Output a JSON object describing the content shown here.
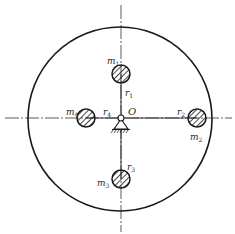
{
  "diagram": {
    "type": "rotor balancing schematic",
    "colors": {
      "stroke": "#1a1a1a",
      "axis": "#333333",
      "background": "#ffffff"
    },
    "disc": {
      "cx": 120,
      "cy": 119,
      "r": 92
    },
    "pivot": {
      "label": "O",
      "x": 121,
      "y": 118
    },
    "axes": {
      "horizontal": {
        "y": 118,
        "x1": 5,
        "x2": 232
      },
      "vertical": {
        "x": 121,
        "y1": 5,
        "y2": 232
      }
    },
    "masses": [
      {
        "id": "m1",
        "mass_label": "m",
        "mass_sub": "1",
        "radius_label": "r",
        "radius_sub": "1",
        "cx": 121,
        "cy": 74,
        "r": 9
      },
      {
        "id": "m2",
        "mass_label": "m",
        "mass_sub": "2",
        "radius_label": "r",
        "radius_sub": "2",
        "cx": 197,
        "cy": 118,
        "r": 9
      },
      {
        "id": "m3",
        "mass_label": "m",
        "mass_sub": "3",
        "radius_label": "r",
        "radius_sub": "3",
        "cx": 121,
        "cy": 179,
        "r": 9
      },
      {
        "id": "m4",
        "mass_label": "m",
        "mass_sub": "4",
        "radius_label": "r",
        "radius_sub": "4",
        "cx": 86,
        "cy": 118,
        "r": 9
      }
    ]
  }
}
